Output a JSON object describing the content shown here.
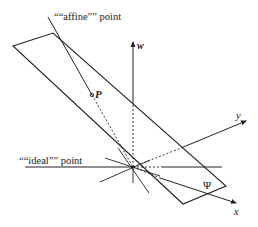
{
  "diagram": {
    "labels": {
      "affine_point": "““affine”” point",
      "ideal_point": "““ideal”” point",
      "point_p": "P",
      "axis_w": "w",
      "axis_y": "y",
      "axis_x": "x",
      "plane": "Ψ"
    },
    "colors": {
      "stroke": "#222222",
      "background": "#ffffff"
    },
    "geometry": {
      "origin": [
        133,
        167
      ],
      "plane_vertices": [
        [
          13,
          46
        ],
        [
          53,
          33
        ],
        [
          226,
          186
        ],
        [
          183,
          204
        ]
      ],
      "point_p": [
        92,
        95
      ]
    }
  }
}
